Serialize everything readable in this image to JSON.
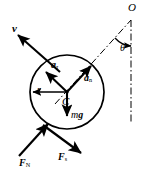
{
  "figure": {
    "kind": "free-body-diagram",
    "width": 149,
    "height": 179,
    "background_color": "#ffffff",
    "stroke_color": "#000000"
  },
  "labels": {
    "velocity": "v",
    "center_point": "C",
    "pivot_point": "O",
    "angle": "θ",
    "radius": "r",
    "tangential_acceleration": "a",
    "tangential_acceleration_sub": "τ",
    "normal_acceleration": "a",
    "normal_acceleration_sub": "n",
    "weight_mass": "m",
    "weight_gravity": "g",
    "normal_force": "F",
    "normal_force_sub": "N",
    "friction_force": "F",
    "friction_force_sub": "s"
  },
  "geometry": {
    "circle": {
      "cx": 67,
      "cy": 92,
      "r": 37
    },
    "center_dot": {
      "cx": 67,
      "cy": 92,
      "r": 1.6
    },
    "vectors": [
      {
        "name": "velocity",
        "x1": 58,
        "y1": 70,
        "x2": 16,
        "y2": 33
      },
      {
        "name": "tangential-acceleration",
        "x1": 67,
        "y1": 92,
        "x2": 44,
        "y2": 70
      },
      {
        "name": "normal-acceleration",
        "x1": 67,
        "y1": 92,
        "x2": 93,
        "y2": 64
      },
      {
        "name": "weight",
        "x1": 67,
        "y1": 92,
        "x2": 67,
        "y2": 118
      },
      {
        "name": "radius",
        "x1": 67,
        "y1": 92,
        "x2": 31,
        "y2": 92
      },
      {
        "name": "normal-force",
        "x1": 20,
        "y1": 155,
        "x2": 47,
        "y2": 125
      },
      {
        "name": "friction-force",
        "x1": 44,
        "y1": 126,
        "x2": 80,
        "y2": 152
      }
    ],
    "dash_dot_lines": [
      {
        "name": "center-to-pivot",
        "x1": 55,
        "y1": 104,
        "x2": 131,
        "y2": 20
      },
      {
        "name": "vertical-through-pivot",
        "x1": 131,
        "y1": 20,
        "x2": 131,
        "y2": 124
      }
    ],
    "angle_arc": {
      "cx": 131,
      "cy": 20,
      "r": 26,
      "from": "incline-line",
      "to": "vertical-line"
    }
  }
}
